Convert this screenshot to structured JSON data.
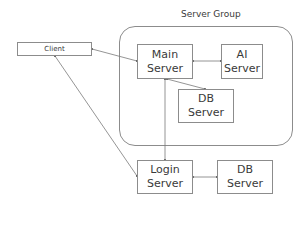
{
  "diagram": {
    "group": {
      "label": "Server Group"
    },
    "nodes": {
      "client": {
        "label": "Client"
      },
      "main_server": {
        "line1": "Main",
        "line2": "Server"
      },
      "ai_server": {
        "line1": "AI",
        "line2": "Server"
      },
      "db_server_group": {
        "line1": "DB",
        "line2": "Server"
      },
      "login_server": {
        "line1": "Login",
        "line2": "Server"
      },
      "db_server_login": {
        "line1": "DB",
        "line2": "Server"
      }
    },
    "edges": [
      {
        "from": "client",
        "to": "main_server",
        "arrows": "both"
      },
      {
        "from": "client",
        "to": "login_server",
        "arrows": "both"
      },
      {
        "from": "main_server",
        "to": "ai_server",
        "arrows": "both"
      },
      {
        "from": "main_server",
        "to": "db_server_group",
        "arrows": "both"
      },
      {
        "from": "main_server",
        "to": "login_server",
        "arrows": "both"
      },
      {
        "from": "login_server",
        "to": "db_server_login",
        "arrows": "both"
      }
    ],
    "colors": {
      "stroke": "#8c8c8c",
      "text": "#3a3a3a",
      "background": "#ffffff"
    }
  }
}
